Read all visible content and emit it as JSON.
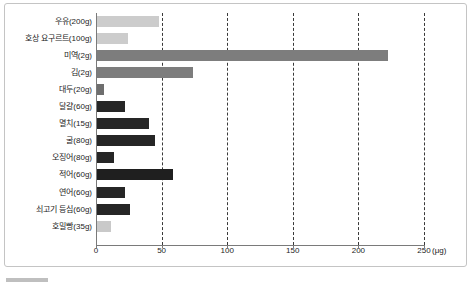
{
  "chart_data": {
    "type": "bar",
    "orientation": "horizontal",
    "title": "",
    "xlabel": "(μg)",
    "ylabel": "",
    "xlim": [
      0,
      265
    ],
    "xticks": [
      0,
      50,
      100,
      150,
      200,
      250
    ],
    "xtick_labels": [
      "0",
      "50",
      "100",
      "150",
      "200",
      "250"
    ],
    "unit": "(μg)",
    "grid": "vertical-dashed",
    "legend": "none",
    "categories": [
      "우유(200g)",
      "호상 요구르트(100g)",
      "미역(2g)",
      "김(2g)",
      "대두(20g)",
      "달걀(60g)",
      "멸치(15g)",
      "굴(80g)",
      "오징어(80g)",
      "적어(60g)",
      "연어(60g)",
      "쇠고기 등심(60g)",
      "호밀빵(35g)"
    ],
    "values": [
      47,
      24,
      222,
      73,
      5,
      21,
      40,
      44,
      13,
      58,
      21,
      25,
      11
    ],
    "bar_colors": [
      "#cccccc",
      "#cccccc",
      "#7d7d7d",
      "#7d7d7d",
      "#6e6e6e",
      "#262626",
      "#262626",
      "#262626",
      "#262626",
      "#1f1f1f",
      "#262626",
      "#262626",
      "#c9c9c9"
    ]
  },
  "colors": {
    "axis": "#7a7a7a",
    "gridline": "#3a3a3a",
    "text": "#1c1c1c",
    "frame": "#c4c4c4",
    "background": "#ffffff"
  }
}
